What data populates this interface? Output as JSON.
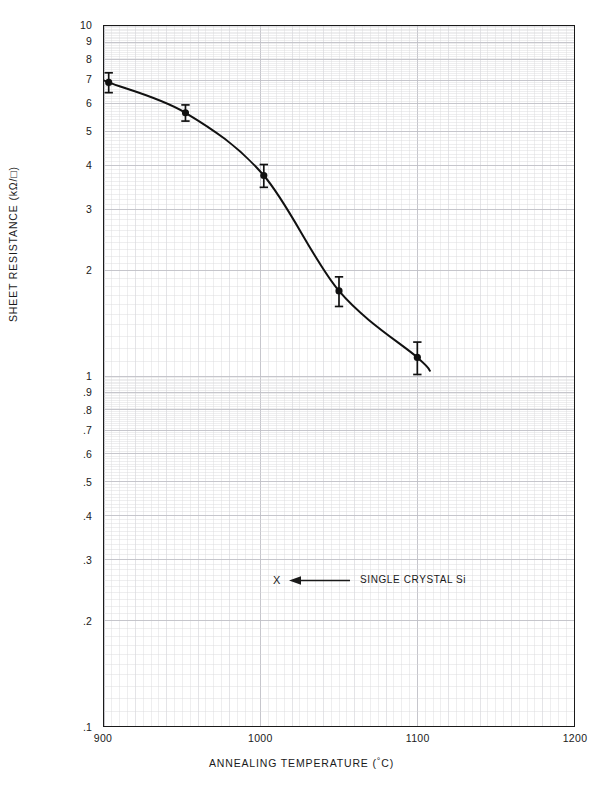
{
  "chart_data": {
    "type": "line",
    "title": "",
    "xlabel": "ANNEALING TEMPERATURE (°C)",
    "ylabel": "SHEET RESISTANCE (kΩ/□)",
    "xlim": [
      900,
      1200
    ],
    "ylim": [
      0.1,
      10
    ],
    "yscale": "log",
    "xscale": "linear",
    "grid": true,
    "grid_type": "log-log graph paper (fine minor grid)",
    "legend": "none",
    "x_ticks": [
      "900",
      "1000",
      "1100",
      "1200"
    ],
    "x_tick_values": [
      900,
      1000,
      1100,
      1200
    ],
    "y_ticks": [
      "10",
      "9",
      "8",
      "7",
      "6",
      "5",
      "4",
      "3",
      "2",
      "1",
      ".9",
      ".8",
      ".7",
      ".6",
      ".5",
      ".4",
      ".3",
      ".2",
      ".1"
    ],
    "y_tick_values": [
      10,
      9,
      8,
      7,
      6,
      5,
      4,
      3,
      2,
      1,
      0.9,
      0.8,
      0.7,
      0.6,
      0.5,
      0.4,
      0.3,
      0.2,
      0.1
    ],
    "series": [
      {
        "name": "Sheet resistance vs annealing temperature",
        "marker": "filled-circle-with-error-bars",
        "line": "solid",
        "color": "#111111",
        "x": [
          903,
          952,
          1002,
          1050,
          1100
        ],
        "y": [
          6.9,
          5.65,
          3.74,
          1.75,
          1.13
        ],
        "yerr": [
          0.45,
          0.3,
          0.28,
          0.17,
          0.12
        ]
      }
    ],
    "annotations": [
      {
        "name": "single-crystal-si-callout",
        "marker_text": "X",
        "arrow": "left-arrow",
        "label": "SINGLE CRYSTAL Si",
        "x_value": 1017,
        "y_value": 0.262
      }
    ]
  },
  "axes": {
    "x_title": "ANNEALING TEMPERATURE (",
    "x_title_deg": "°",
    "x_title_tail": "C)",
    "y_title": "SHEET RESISTANCE (kΩ/□)"
  },
  "annotation": {
    "x_marker": "X",
    "label": "SINGLE CRYSTAL Si"
  },
  "colors": {
    "ink": "#1a1a1a",
    "curve": "#111111",
    "grid_minor": "#d8d8dc",
    "grid_major": "#bfbfc6",
    "background": "#ffffff"
  }
}
